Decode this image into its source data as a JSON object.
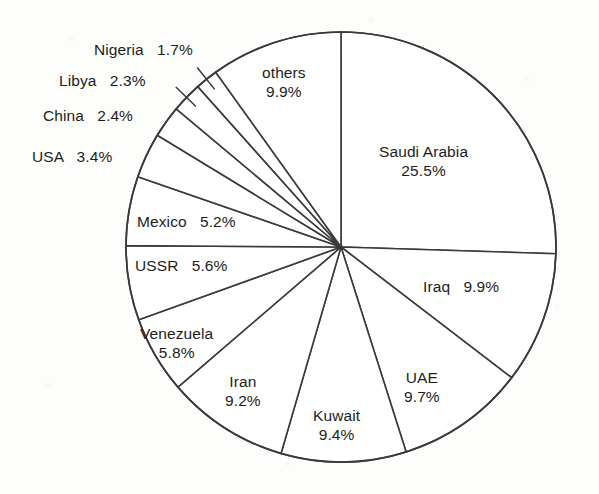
{
  "chart_data": {
    "type": "pie",
    "title": "",
    "subtitle": "",
    "xlabel": "",
    "ylabel": "",
    "grid": false,
    "legend_position": "none",
    "start_angle_deg": 0,
    "direction": "clockwise",
    "total_percent": 100.0,
    "units": "percent",
    "categories": [
      "Saudi Arabia",
      "Iraq",
      "UAE",
      "Kuwait",
      "Iran",
      "Venezuela",
      "USSR",
      "Mexico",
      "USA",
      "China",
      "Libya",
      "Nigeria",
      "others"
    ],
    "values": [
      25.5,
      9.9,
      9.7,
      9.4,
      9.2,
      5.8,
      5.6,
      5.2,
      3.4,
      2.4,
      2.3,
      1.7,
      9.9
    ],
    "slices": [
      {
        "name": "Saudi Arabia",
        "value": 25.5,
        "value_text": "25.5%",
        "label_layout": "two-line"
      },
      {
        "name": "Iraq",
        "value": 9.9,
        "value_text": "9.9%",
        "label_layout": "one-line"
      },
      {
        "name": "UAE",
        "value": 9.7,
        "value_text": "9.7%",
        "label_layout": "two-line"
      },
      {
        "name": "Kuwait",
        "value": 9.4,
        "value_text": "9.4%",
        "label_layout": "two-line"
      },
      {
        "name": "Iran",
        "value": 9.2,
        "value_text": "9.2%",
        "label_layout": "two-line"
      },
      {
        "name": "Venezuela",
        "value": 5.8,
        "value_text": "5.8%",
        "label_layout": "two-line"
      },
      {
        "name": "USSR",
        "value": 5.6,
        "value_text": "5.6%",
        "label_layout": "one-line"
      },
      {
        "name": "Mexico",
        "value": 5.2,
        "value_text": "5.2%",
        "label_layout": "one-line"
      },
      {
        "name": "USA",
        "value": 3.4,
        "value_text": "3.4%",
        "label_layout": "one-line"
      },
      {
        "name": "China",
        "value": 2.4,
        "value_text": "2.4%",
        "label_layout": "one-line"
      },
      {
        "name": "Libya",
        "value": 2.3,
        "value_text": "2.3%",
        "label_layout": "one-line"
      },
      {
        "name": "Nigeria",
        "value": 1.7,
        "value_text": "1.7%",
        "label_layout": "one-line"
      },
      {
        "name": "others",
        "value": 9.9,
        "value_text": "9.9%",
        "label_layout": "two-line"
      }
    ],
    "colors": {
      "slice_fill": "#ffffff",
      "slice_stroke": "#3a3a3a",
      "label_text": "#1d1d1d",
      "background": "#fdfdfc"
    }
  },
  "labels": {
    "saudi_arabia": {
      "name": "Saudi Arabia",
      "value": "25.5%"
    },
    "iraq": {
      "name": "Iraq",
      "value": "9.9%"
    },
    "uae": {
      "name": "UAE",
      "value": "9.7%"
    },
    "kuwait": {
      "name": "Kuwait",
      "value": "9.4%"
    },
    "iran": {
      "name": "Iran",
      "value": "9.2%"
    },
    "venezuela": {
      "name": "Venezuela",
      "value": "5.8%"
    },
    "ussr": {
      "name": "USSR",
      "value": "5.6%"
    },
    "mexico": {
      "name": "Mexico",
      "value": "5.2%"
    },
    "usa": {
      "name": "USA",
      "value": "3.4%"
    },
    "china": {
      "name": "China",
      "value": "2.4%"
    },
    "libya": {
      "name": "Libya",
      "value": "2.3%"
    },
    "nigeria": {
      "name": "Nigeria",
      "value": "1.7%"
    },
    "others": {
      "name": "others",
      "value": "9.9%"
    }
  }
}
